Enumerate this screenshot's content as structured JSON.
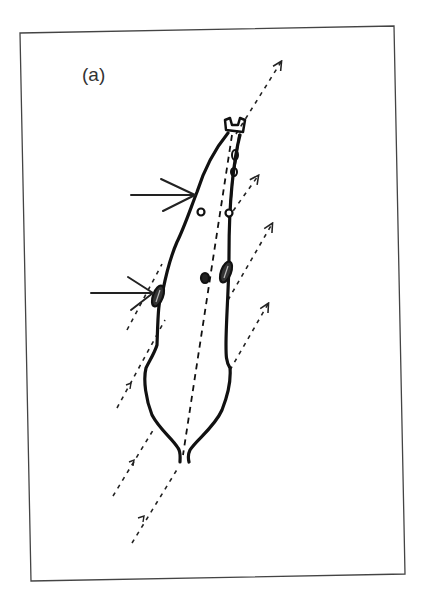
{
  "figure": {
    "panel_label": "(a)",
    "colors": {
      "background": "#ffffff",
      "frame": "#444444",
      "ink": "#111111",
      "dashed": "#222222"
    },
    "elements": {
      "frame": "rectangular border (slightly rotated scan)",
      "body": "elongated animal outline viewed from above, head pointing up-right, forked tail at bottom",
      "midline": "dashed centre line along body axis",
      "solid_arrows": 2,
      "dashed_arrows": 7,
      "markers": [
        "small circle left",
        "small circle right",
        "central spot",
        "left shaded oval",
        "right shaded oval",
        "head clip"
      ]
    }
  }
}
